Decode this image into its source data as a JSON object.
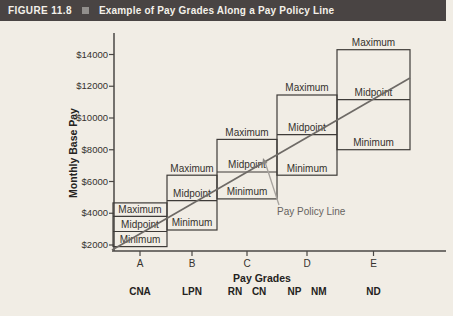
{
  "header": {
    "figure_label": "FIGURE 11.8",
    "bullet_icon": "square-bullet",
    "title": "Example of Pay Grades Along a Pay Policy Line"
  },
  "chart_data": {
    "type": "bar",
    "subtype": "floating-range-boxes",
    "title": "Example of Pay Grades Along a Pay Policy Line",
    "xlabel": "Pay Grades",
    "ylabel": "Monthly Base Pay",
    "y_ticks": [
      2000,
      4000,
      6000,
      8000,
      10000,
      12000,
      14000
    ],
    "y_tick_labels": [
      "$2000",
      "$4000",
      "$6000",
      "$8000",
      "$10000",
      "$12000",
      "$14000"
    ],
    "ylim": [
      1500,
      15500
    ],
    "grid": false,
    "legend": false,
    "x_categories": [
      "A",
      "B",
      "C",
      "D",
      "E"
    ],
    "range_labels": {
      "maximum": "Maximum",
      "midpoint": "Midpoint",
      "minimum": "Minimum"
    },
    "grades": [
      {
        "grade": "A",
        "job": "CNA",
        "min": 1900,
        "midpoint": 2850,
        "max": 3800,
        "box_top": 4650
      },
      {
        "grade": "B",
        "job": "LPN",
        "min": 2950,
        "midpoint": 4800,
        "max": 6400
      },
      {
        "grade": "C",
        "job": "RN CN",
        "min": 4900,
        "midpoint": 6600,
        "max": 8650
      },
      {
        "grade": "D",
        "job": "NP NM",
        "min": 6400,
        "midpoint": 8950,
        "max": 11450
      },
      {
        "grade": "E",
        "job": "ND",
        "min": 8000,
        "midpoint": 11150,
        "max": 14300
      }
    ],
    "pay_policy_line": {
      "label": "Pay Policy Line",
      "start_value": 1700,
      "end_value": 12500,
      "passes_through": "midpoints of grades A-E"
    }
  }
}
